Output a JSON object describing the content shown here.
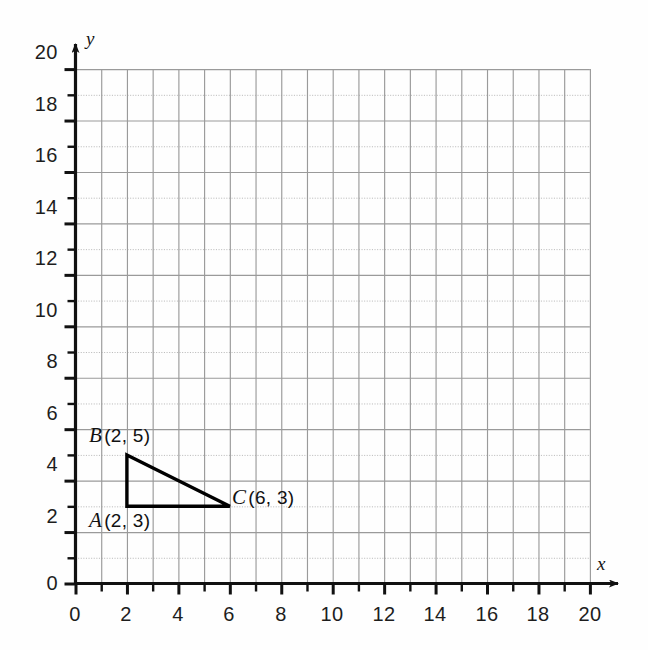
{
  "chart_data": {
    "type": "scatter",
    "title": "",
    "xlabel": "x",
    "ylabel": "y",
    "xlim": [
      0,
      20
    ],
    "ylim": [
      0,
      20
    ],
    "grid": true,
    "grid_step_minor": 1,
    "grid_step_major": 2,
    "x_ticks_major": [
      0,
      2,
      4,
      6,
      8,
      10,
      12,
      14,
      16,
      18,
      20
    ],
    "y_ticks_major": [
      0,
      2,
      4,
      6,
      8,
      10,
      12,
      14,
      16,
      18,
      20
    ],
    "x_tick_labels": [
      "0",
      "2",
      "4",
      "6",
      "8",
      "10",
      "12",
      "14",
      "16",
      "18",
      "20"
    ],
    "y_tick_labels": [
      "0",
      "2",
      "4",
      "6",
      "8",
      "10",
      "12",
      "14",
      "16",
      "18",
      "20"
    ],
    "tick_interval_minor": 1,
    "legend": null,
    "annotations": [
      {
        "name": "A",
        "label": "A (2, 3)",
        "x": 2,
        "y": 3
      },
      {
        "name": "B",
        "label": "B (2, 5)",
        "x": 2,
        "y": 5
      },
      {
        "name": "C",
        "label": "C (6, 3)",
        "x": 6,
        "y": 3
      }
    ],
    "shapes": [
      {
        "type": "polygon",
        "name": "triangle-ABC",
        "points": [
          [
            2,
            3
          ],
          [
            2,
            5
          ],
          [
            6,
            3
          ]
        ],
        "closed": true,
        "stroke": "#000000",
        "fill": "none"
      }
    ]
  },
  "axes": {
    "x_axis_name": "x",
    "y_axis_name": "y",
    "x_tick_labels": [
      "0",
      "2",
      "4",
      "6",
      "8",
      "10",
      "12",
      "14",
      "16",
      "18",
      "20"
    ],
    "y_tick_labels": [
      "20",
      "18",
      "16",
      "14",
      "12",
      "10",
      "8",
      "6",
      "4",
      "2",
      "0"
    ],
    "origin_label": "0"
  },
  "vertices": [
    {
      "id": "A",
      "name": "A",
      "coords": "(2, 3)",
      "label": "A (2, 3)",
      "x": 2,
      "y": 3
    },
    {
      "id": "B",
      "name": "B",
      "coords": "(2, 5)",
      "label": "B (2, 5)",
      "x": 2,
      "y": 5
    },
    {
      "id": "C",
      "name": "C",
      "coords": "(6, 3)",
      "label": "C (6, 3)",
      "x": 6,
      "y": 3
    }
  ],
  "colors": {
    "background": "#fefefe",
    "grid_major": "#9a9a9a",
    "grid_minor": "#bcbcbc",
    "axis": "#111111",
    "shape_stroke": "#000000",
    "text": "#1a1a1a"
  }
}
